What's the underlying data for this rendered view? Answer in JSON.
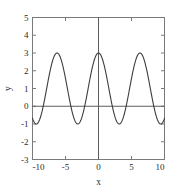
{
  "chart_data": {
    "type": "line",
    "title": "",
    "xlabel": "x",
    "ylabel": "y",
    "xlim": [
      -10,
      10
    ],
    "ylim": [
      -3,
      5
    ],
    "xticks": [
      -10,
      -5,
      0,
      5,
      10
    ],
    "xticklabels": [
      "-10",
      "-5",
      "0",
      "5",
      "10"
    ],
    "yticks": [
      -3,
      -2,
      -1,
      0,
      1,
      2,
      3,
      4,
      5
    ],
    "yticklabels": [
      "-3",
      "-2",
      "-1",
      "0",
      "1",
      "2",
      "3",
      "4",
      "5"
    ],
    "grid": false,
    "legend": null,
    "series": [
      {
        "name": "1 + 2*cos(x)",
        "expression": "y = 1 + 2*cos(x)",
        "amplitude": 2,
        "offset": 1,
        "period": 6.283,
        "ymax": 3,
        "ymin": -1,
        "color": "#3d3d3d",
        "x": [
          -10,
          -9.5,
          -9,
          -8.5,
          -8,
          -7.5,
          -7,
          -6.5,
          -6,
          -5.5,
          -5,
          -4.5,
          -4,
          -3.5,
          -3,
          -2.5,
          -2,
          -1.5,
          -1,
          -0.5,
          0,
          0.5,
          1,
          1.5,
          2,
          2.5,
          3,
          3.5,
          4,
          4.5,
          5,
          5.5,
          6,
          6.5,
          7,
          7.5,
          8,
          8.5,
          9,
          9.5,
          10
        ],
        "y": [
          -0.68,
          -0.11,
          0.18,
          1.21,
          0.71,
          1.35,
          2.51,
          2.94,
          2.92,
          2.42,
          1.57,
          0.58,
          -0.31,
          -0.87,
          -0.98,
          -0.6,
          0.17,
          1.14,
          2.08,
          2.76,
          3.0,
          2.76,
          2.08,
          1.14,
          0.17,
          -0.6,
          -0.98,
          -0.87,
          -0.31,
          0.58,
          1.57,
          2.42,
          2.92,
          2.94,
          2.51,
          1.35,
          0.71,
          1.21,
          0.18,
          -0.11,
          -0.68
        ]
      }
    ]
  },
  "axes": {
    "x_axis_label": "x",
    "y_axis_label": "y"
  },
  "colors": {
    "background": "#ffffff",
    "curve": "#3d3d3d",
    "frame": "#7a7a7a",
    "zero_axis": "#5c5c5c",
    "text": "#2b2b2b"
  }
}
